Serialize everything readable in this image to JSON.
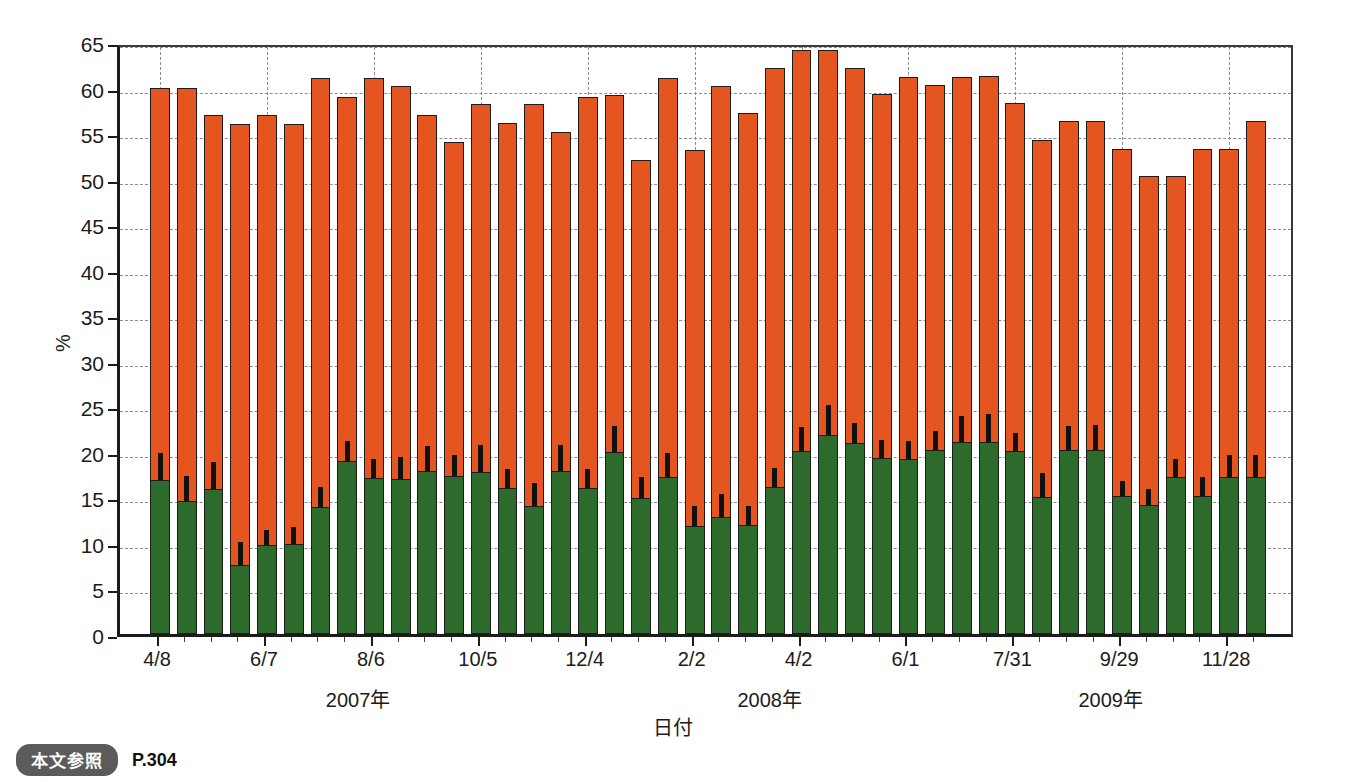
{
  "caption": {
    "badge": "本文参照",
    "page": "P.304"
  },
  "chart_data": {
    "type": "bar",
    "subtype": "stacked-bar-with-error-bars",
    "title": "",
    "xlabel": "日付",
    "ylabel": "%",
    "ylim": [
      0,
      65
    ],
    "ytick_step": 5,
    "yticks": [
      0,
      5,
      10,
      15,
      20,
      25,
      30,
      35,
      40,
      45,
      50,
      55,
      60,
      65
    ],
    "grid": true,
    "legend_position": "none",
    "colors": {
      "total_bar": "#E4551F",
      "lower_segment": "#2C6B2B",
      "error_bar": "#111111",
      "axis": "#1b1b1b",
      "gridline": "#8d8d8d"
    },
    "series": [
      {
        "name": "total",
        "color": "#E4551F",
        "values": [
          60.0,
          60.0,
          57.0,
          56.0,
          57.0,
          56.0,
          61.0,
          59.0,
          61.0,
          60.2,
          57.0,
          54.0,
          58.2,
          56.1,
          58.2,
          55.1,
          59.0,
          59.2,
          52.0,
          61.1,
          53.1,
          60.2,
          57.2,
          62.2,
          64.1,
          64.1,
          62.2,
          59.3,
          61.2,
          60.3,
          61.2,
          61.3,
          58.3,
          54.2,
          56.3,
          56.3,
          53.3,
          50.3,
          50.3,
          53.2,
          53.2,
          56.3
        ]
      },
      {
        "name": "lower",
        "color": "#2C6B2B",
        "values": [
          16.9,
          14.6,
          15.9,
          7.6,
          9.8,
          9.9,
          13.9,
          19.0,
          17.1,
          17.0,
          17.9,
          17.3,
          17.8,
          16.0,
          14.1,
          17.9,
          16.0,
          20.0,
          14.9,
          17.2,
          11.9,
          12.9,
          12.0,
          16.1,
          20.1,
          21.9,
          21.0,
          19.3,
          19.2,
          20.2,
          21.1,
          21.1,
          20.1,
          15.0,
          20.2,
          20.2,
          15.1,
          14.2,
          17.2,
          15.1,
          17.2,
          17.2
        ]
      },
      {
        "name": "error_top",
        "color": "#111111",
        "values": [
          19.9,
          17.4,
          18.9,
          10.1,
          11.4,
          11.8,
          16.1,
          21.2,
          19.2,
          19.4,
          20.6,
          19.6,
          20.7,
          18.1,
          16.6,
          20.7,
          18.1,
          22.8,
          17.2,
          19.9,
          14.0,
          15.4,
          14.1,
          18.2,
          22.7,
          25.1,
          23.2,
          21.3,
          21.2,
          22.3,
          23.9,
          24.2,
          22.1,
          17.7,
          22.8,
          23.0,
          16.8,
          15.9,
          19.2,
          17.2,
          19.7,
          19.6
        ]
      }
    ],
    "xtick_labels": [
      "4/8",
      "6/7",
      "8/6",
      "10/5",
      "12/4",
      "2/2",
      "4/2",
      "6/1",
      "7/31",
      "9/29",
      "11/28",
      "1/27",
      "3/28",
      "5/27",
      "7/26",
      "9/24"
    ],
    "year_groups": [
      {
        "label": "2007年"
      },
      {
        "label": "2008年"
      },
      {
        "label": "2009年"
      }
    ]
  }
}
